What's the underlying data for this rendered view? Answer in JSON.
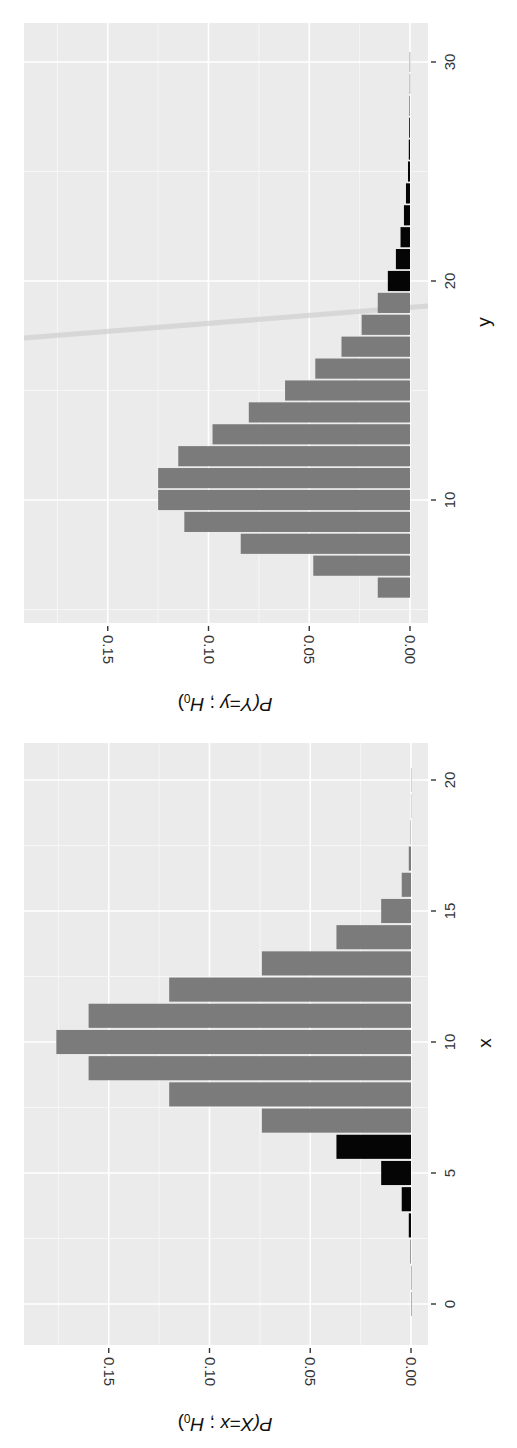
{
  "chart_data": [
    {
      "type": "bar",
      "panel": "top",
      "orientation": "figure rotated 90 degrees",
      "xlabel": "y",
      "ylabel": "P(Y=y ; H0)",
      "ylabel_parts": {
        "prefix": "P(",
        "var": "Y",
        "eq": "=",
        "val": "y",
        "sep": " ; ",
        "h": "H",
        "sub": "0",
        "suffix": ")"
      },
      "x": [
        6,
        7,
        8,
        9,
        10,
        11,
        12,
        13,
        14,
        15,
        16,
        17,
        18,
        19,
        20,
        21,
        22,
        23,
        24,
        25,
        26,
        27,
        28,
        29,
        30
      ],
      "values": [
        0.016,
        0.048,
        0.084,
        0.112,
        0.125,
        0.125,
        0.115,
        0.098,
        0.08,
        0.062,
        0.047,
        0.034,
        0.024,
        0.016,
        0.011,
        0.007,
        0.0047,
        0.003,
        0.002,
        0.001,
        0.0006,
        0.0004,
        0.0002,
        0.0001,
        0.0001
      ],
      "highlight_rule": "y >= 20 shown in black (rejection region)",
      "highlight_from": 20,
      "highlight_side": "upper",
      "colors": {
        "normal": "#7b7b7b",
        "highlight": "#050505",
        "panel": "#ebebeb",
        "grid": "#ffffff"
      },
      "x_ticks": [
        "10",
        "20",
        "30"
      ],
      "x_tick_values": [
        10,
        20,
        30
      ],
      "xlim": [
        4.4,
        31.8
      ],
      "y_ticks": [
        "0.00",
        "0.05",
        "0.10",
        "0.15"
      ],
      "y_tick_values": [
        0,
        0.05,
        0.1,
        0.15
      ],
      "ylim": [
        0,
        0.19
      ],
      "grid": true
    },
    {
      "type": "bar",
      "panel": "bottom",
      "orientation": "figure rotated 90 degrees",
      "xlabel": "x",
      "ylabel": "P(X=x ; H0)",
      "ylabel_parts": {
        "prefix": "P(",
        "var": "X",
        "eq": "=",
        "val": "x",
        "sep": " ; ",
        "h": "H",
        "sub": "0",
        "suffix": ")"
      },
      "x": [
        0,
        1,
        2,
        3,
        4,
        5,
        6,
        7,
        8,
        9,
        10,
        11,
        12,
        13,
        14,
        15,
        16,
        17,
        18,
        19,
        20
      ],
      "values": [
        1e-06,
        2e-05,
        0.0002,
        0.0011,
        0.0046,
        0.0148,
        0.037,
        0.074,
        0.12,
        0.16,
        0.176,
        0.16,
        0.12,
        0.074,
        0.037,
        0.0148,
        0.0046,
        0.0011,
        0.0002,
        2e-05,
        1e-06
      ],
      "highlight_rule": "x <= 6 shown in black (rejection region)",
      "highlight_from": 6,
      "highlight_side": "lower",
      "colors": {
        "normal": "#7b7b7b",
        "highlight": "#050505",
        "panel": "#ebebeb",
        "grid": "#ffffff"
      },
      "x_ticks": [
        "0",
        "5",
        "10",
        "15",
        "20"
      ],
      "x_tick_values": [
        0,
        5,
        10,
        15,
        20
      ],
      "xlim": [
        -1.5,
        21.5
      ],
      "y_ticks": [
        "0.00",
        "0.05",
        "0.10",
        "0.15"
      ],
      "y_tick_values": [
        0,
        0.05,
        0.1,
        0.15
      ],
      "ylim": [
        0,
        0.19
      ],
      "grid": true
    }
  ]
}
